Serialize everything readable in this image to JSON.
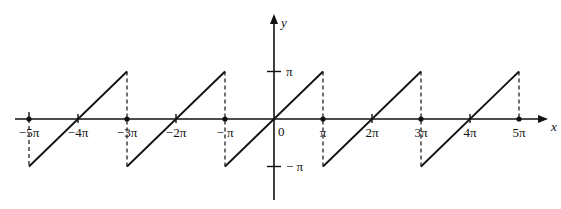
{
  "figure": {
    "axes": {
      "x_label": "x",
      "y_label": "y",
      "origin_label": "0",
      "y_ticks": [
        {
          "value": 1,
          "label": "π"
        },
        {
          "value": -1,
          "label": "− π"
        }
      ],
      "x_ticks": [
        {
          "value": -5,
          "label": "−5π",
          "marker": "dot"
        },
        {
          "value": -4,
          "label": "−4π",
          "marker": "tick"
        },
        {
          "value": -3,
          "label": "−3π",
          "marker": "dot"
        },
        {
          "value": -2,
          "label": "−2π",
          "marker": "tick"
        },
        {
          "value": -1,
          "label": "− π",
          "marker": "dot"
        },
        {
          "value": 1,
          "label": "π",
          "marker": "dot"
        },
        {
          "value": 2,
          "label": "2π",
          "marker": "tick"
        },
        {
          "value": 3,
          "label": "3π",
          "marker": "dot"
        },
        {
          "value": 4,
          "label": "4π",
          "marker": "tick"
        },
        {
          "value": 5,
          "label": "5π",
          "marker": "dot"
        }
      ]
    },
    "segments_center_multiple_of_pi": [
      -4,
      -2,
      0,
      2,
      4
    ],
    "jump_positions_multiple_of_pi": [
      -5,
      -3,
      -1,
      1,
      3,
      5
    ],
    "colors": {
      "stroke": "#111111",
      "background": "#ffffff"
    }
  }
}
